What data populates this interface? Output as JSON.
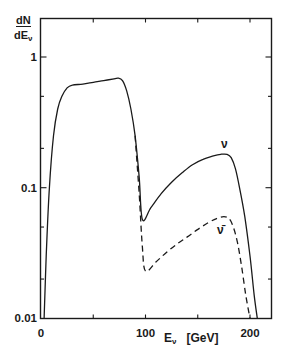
{
  "chart_data": {
    "type": "line",
    "title": "",
    "xlabel": "E_ν [GeV]",
    "ylabel": "dN/dE_ν",
    "xlim": [
      0,
      220
    ],
    "ylim": [
      0.01,
      1.5
    ],
    "yscale": "log",
    "x_ticks": [
      0,
      100,
      200
    ],
    "x_tick_labels": [
      "0",
      "100",
      "200"
    ],
    "y_ticks": [
      0.01,
      0.1,
      1
    ],
    "y_tick_labels": [
      "0.01",
      "0.1",
      "1"
    ],
    "grid": false,
    "legend": "inline labels",
    "series": [
      {
        "name": "ν",
        "style": "solid",
        "x": [
          3,
          5,
          8,
          12,
          16,
          20,
          25,
          30,
          40,
          50,
          60,
          70,
          74,
          78,
          82,
          86,
          90,
          94,
          97,
          105,
          115,
          125,
          135,
          145,
          155,
          165,
          172,
          178,
          182,
          186,
          190,
          195,
          200,
          204,
          207
        ],
        "y": [
          0.01,
          0.03,
          0.1,
          0.25,
          0.4,
          0.5,
          0.58,
          0.61,
          0.62,
          0.64,
          0.66,
          0.68,
          0.69,
          0.66,
          0.55,
          0.4,
          0.25,
          0.12,
          0.057,
          0.07,
          0.09,
          0.11,
          0.13,
          0.15,
          0.165,
          0.175,
          0.18,
          0.18,
          0.17,
          0.14,
          0.1,
          0.06,
          0.03,
          0.015,
          0.01
        ]
      },
      {
        "name": "ν̄",
        "style": "dashed",
        "x": [
          90,
          94,
          97,
          100,
          110,
          120,
          130,
          140,
          150,
          160,
          168,
          175,
          180,
          184,
          188,
          192,
          196,
          200
        ],
        "y": [
          0.25,
          0.09,
          0.035,
          0.023,
          0.027,
          0.032,
          0.037,
          0.042,
          0.048,
          0.054,
          0.058,
          0.06,
          0.058,
          0.05,
          0.038,
          0.025,
          0.015,
          0.01
        ]
      }
    ],
    "annotations": [
      {
        "text": "ν",
        "x": 178,
        "y": 0.21
      },
      {
        "text": "ν̄",
        "x": 175,
        "y": 0.045
      }
    ]
  },
  "labels": {
    "y_numerator": "dN",
    "y_denominator_main": "dE",
    "y_denominator_sub": "ν",
    "x_main": "E",
    "x_sub": "ν",
    "x_unit": "[GeV]",
    "nu": "ν",
    "nubar": "ν̄"
  },
  "colors": {
    "line": "#1a1a1a",
    "background": "#ffffff"
  }
}
